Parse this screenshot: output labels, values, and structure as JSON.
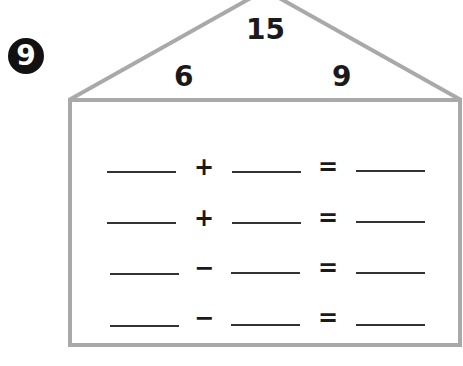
{
  "problem": {
    "number_badge": "9",
    "number_house": {
      "whole": "15",
      "part_left": "6",
      "part_right": "9"
    },
    "colors": {
      "outline": "#a9a9a9",
      "badge_bg": "#111111",
      "text": "#1a1a1a"
    },
    "equations": [
      {
        "a": "",
        "op": "+",
        "b": "",
        "eq": "=",
        "c": ""
      },
      {
        "a": "",
        "op": "+",
        "b": "",
        "eq": "=",
        "c": ""
      },
      {
        "a": "",
        "op": "−",
        "b": "",
        "eq": "=",
        "c": ""
      },
      {
        "a": "",
        "op": "−",
        "b": "",
        "eq": "=",
        "c": ""
      }
    ]
  }
}
